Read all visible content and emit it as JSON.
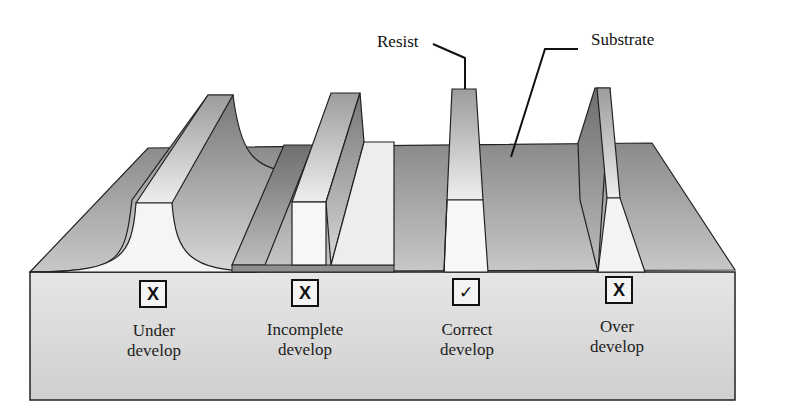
{
  "callouts": {
    "resist": "Resist",
    "substrate": "Substrate"
  },
  "cases": [
    {
      "status_symbol": "X",
      "status": "incorrect",
      "line1": "Under",
      "line2": "develop"
    },
    {
      "status_symbol": "X",
      "status": "incorrect",
      "line1": "Incomplete",
      "line2": "develop"
    },
    {
      "status_symbol": "✓",
      "status": "correct",
      "line1": "Correct",
      "line2": "develop"
    },
    {
      "status_symbol": "X",
      "status": "incorrect",
      "line1": "Over",
      "line2": "develop"
    }
  ],
  "colors": {
    "background": "#ffffff",
    "front_face": "#dcdcdc",
    "substrate_top": "#9a9a9a",
    "resist_front": "#f6f6f6",
    "outline": "#111111"
  }
}
